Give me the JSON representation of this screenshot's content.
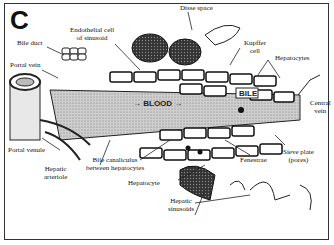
{
  "figure": {
    "panel_letter": "C",
    "labels": {
      "disse_space": "Disse space",
      "endothelial_cell": [
        "Endothelial cell",
        "of sinusoid"
      ],
      "bile_duct": "Bile duct",
      "portal_vein": "Portal vein",
      "kupffer_cell": [
        "Kupffer",
        "cell"
      ],
      "hepatocytes": "Hepatocytes",
      "central_vein": [
        "Central",
        "vein"
      ],
      "portal_venule": "Portal venule",
      "hepatic_arteriole": [
        "Hepatic",
        "arteriole"
      ],
      "bile_canaliculus": [
        "Bile canaliculus",
        "between hepatocytes"
      ],
      "hepatocyte": "Hepatocyte",
      "fenestrae": "Fenestrae",
      "sieve_plate": [
        "Sieve plate",
        "(pores)"
      ],
      "hepatic_sinusoids": [
        "Hepatic",
        "sinusoids"
      ],
      "blood": "BLOOD",
      "bile": "BILE"
    }
  }
}
